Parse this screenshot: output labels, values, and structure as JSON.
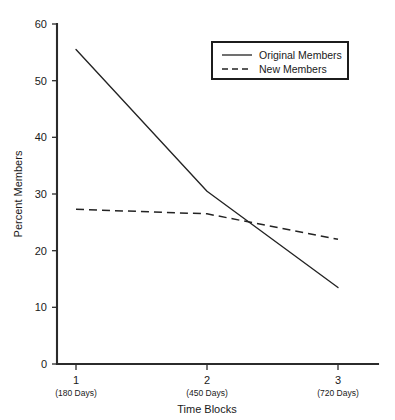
{
  "chart_data": {
    "type": "line",
    "title": "",
    "xlabel": "Time Blocks",
    "ylabel": "Percent Members",
    "x": [
      1,
      2,
      3
    ],
    "categories": [
      "1",
      "2",
      "3"
    ],
    "category_sublabels": [
      "(180 Days)",
      "(450 Days)",
      "(720 Days)"
    ],
    "xlim": [
      0.78,
      3.22
    ],
    "ylim": [
      0,
      60
    ],
    "yticks": [
      0,
      10,
      20,
      30,
      40,
      50,
      60
    ],
    "ytick_labels": [
      "0",
      "10",
      "20",
      "30",
      "40",
      "50",
      "60"
    ],
    "grid": false,
    "legend_position": "top-right",
    "series": [
      {
        "name": "Original Members",
        "style": "solid",
        "color": "#232323",
        "values": [
          55.5,
          30.5,
          13.5
        ]
      },
      {
        "name": "New Members",
        "style": "dashed",
        "color": "#232323",
        "values": [
          27.3,
          26.5,
          22.0
        ]
      }
    ]
  },
  "axes": {
    "y_title": "Percent Members",
    "x_title": "Time Blocks",
    "y_tick_0": "0",
    "y_tick_1": "10",
    "y_tick_2": "20",
    "y_tick_3": "30",
    "y_tick_4": "40",
    "y_tick_5": "50",
    "y_tick_6": "60",
    "x_tick_1_main": "1",
    "x_tick_1_sub": "(180 Days)",
    "x_tick_2_main": "2",
    "x_tick_2_sub": "(450 Days)",
    "x_tick_3_main": "3",
    "x_tick_3_sub": "(720 Days)"
  },
  "legend": {
    "entry_1_label": "Original Members",
    "entry_2_label": "New Members"
  }
}
